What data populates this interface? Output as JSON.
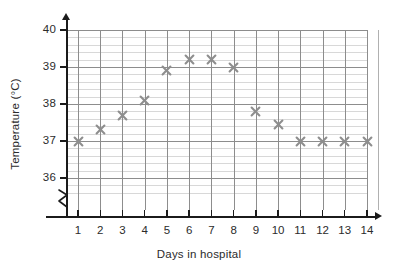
{
  "chart_data": {
    "type": "scatter",
    "title": "",
    "xlabel": "Days in hospital",
    "ylabel": "Temperature (°C)",
    "x": [
      1,
      2,
      3,
      4,
      5,
      6,
      7,
      8,
      9,
      10,
      11,
      12,
      13,
      14
    ],
    "values": [
      37.0,
      37.3,
      37.7,
      38.1,
      38.9,
      39.2,
      39.2,
      39.0,
      37.8,
      37.45,
      37.0,
      37.0,
      37.0,
      37.0
    ],
    "categories": [
      "1",
      "2",
      "3",
      "4",
      "5",
      "6",
      "7",
      "8",
      "9",
      "10",
      "11",
      "12",
      "13",
      "14"
    ],
    "xtick_labels": [
      "1",
      "2",
      "3",
      "4",
      "5",
      "6",
      "7",
      "8",
      "9",
      "10",
      "11",
      "12",
      "13",
      "14"
    ],
    "ytick_labels": [
      "40",
      "39",
      "38",
      "37",
      "36"
    ],
    "ytick_values": [
      40,
      39,
      38,
      37,
      36
    ],
    "ylim": [
      35.5,
      40.0
    ],
    "xlim": [
      0,
      14.6
    ],
    "y_major_step": 1,
    "y_minor_step": 0.2,
    "grid": true,
    "legend": null,
    "axis_break": true,
    "marker_style": "cross",
    "marker_color": "#8e8e8e",
    "grid_major_color": "#8d8d8d",
    "grid_minor_color": "#d8d8d8",
    "axis_color": "#1b1b1b",
    "background": "#ffffff"
  },
  "axes": {
    "x_title": "Days in hospital",
    "y_title": "Temperature (°C)"
  }
}
